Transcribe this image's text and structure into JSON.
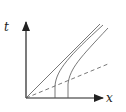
{
  "diagram": {
    "type": "spacetime-diagram",
    "axes": {
      "vertical_label": "t",
      "horizontal_label": "x"
    },
    "colors": {
      "line": "#555555",
      "axis": "#222222",
      "background": "#ffffff"
    },
    "elements": [
      {
        "name": "light-line",
        "style": "solid",
        "description": "straight line from origin"
      },
      {
        "name": "worldline-1",
        "style": "solid",
        "description": "curve starting vertical on x-axis, bending toward light line"
      },
      {
        "name": "worldline-2",
        "style": "solid",
        "description": "curve starting vertical further on x-axis, bending toward light line"
      },
      {
        "name": "simultaneity-line",
        "style": "dashed",
        "description": "dashed line from origin at shallow slope"
      }
    ]
  }
}
